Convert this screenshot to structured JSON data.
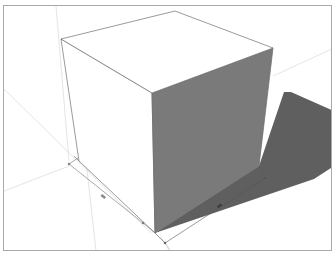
{
  "viewport": {
    "name": "3D modeling viewport",
    "background": "#ffffff",
    "border_color": "#a9a9a9"
  },
  "model": {
    "object": "cube",
    "faces": {
      "top": "#ffffff",
      "front_left": "#ffffff",
      "right": "#7a7a7a"
    },
    "edge_color": "#6e6e6e",
    "shadow_color": "#5f5f5f"
  },
  "guides": {
    "color": "#d6d6d6"
  },
  "dimensions": [
    {
      "id": "dim-left-edge",
      "label": ""
    },
    {
      "id": "dim-right-edge",
      "label": ""
    }
  ]
}
